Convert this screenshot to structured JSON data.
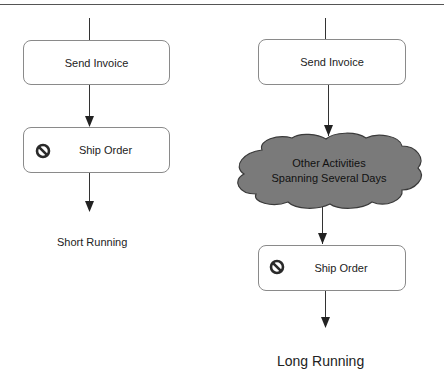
{
  "diagram": {
    "colors": {
      "line": "#333333",
      "box_border": "#8a8a8a",
      "cloud_fill": "#7a7a7a",
      "cloud_stroke": "#3a3a3a",
      "icon": "#2a2a2a"
    },
    "short_running": {
      "caption": "Short Running",
      "steps": [
        {
          "label": "Send Invoice",
          "icon": null
        },
        {
          "label": "Ship Order",
          "icon": "no-entry-icon"
        }
      ]
    },
    "long_running": {
      "caption": "Long Running",
      "steps": [
        {
          "label": "Send Invoice",
          "icon": null
        },
        {
          "label_line1": "Other Activities",
          "label_line2": "Spanning Several Days",
          "shape": "cloud"
        },
        {
          "label": "Ship Order",
          "icon": "no-entry-icon"
        }
      ]
    }
  }
}
